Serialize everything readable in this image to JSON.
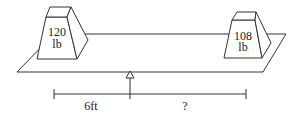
{
  "diagram": {
    "left_weight": {
      "value": "120",
      "unit": "lb"
    },
    "right_weight": {
      "value": "108",
      "unit": "lb"
    },
    "left_distance": "6ft",
    "right_distance": "?",
    "stroke_color": "#333333"
  }
}
